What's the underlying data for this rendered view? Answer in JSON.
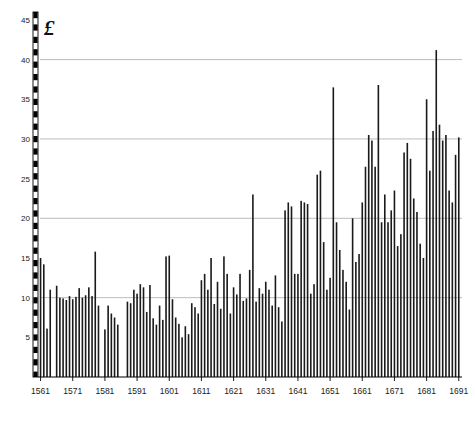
{
  "chart_data": {
    "type": "bar",
    "title": "",
    "subtitle": "",
    "xlabel": "",
    "ylabel": "£",
    "unit_symbol": "£",
    "xlim": [
      1560.2,
      1692.0
    ],
    "ylim": [
      0,
      46
    ],
    "yticks": [
      5,
      10,
      15,
      20,
      25,
      30,
      35,
      40,
      45
    ],
    "ytick_labels": [
      "5",
      "10",
      "15",
      "20",
      "25",
      "30",
      "35",
      "40",
      "45"
    ],
    "gridlines": [
      10,
      20,
      30,
      40
    ],
    "grid": true,
    "grid_color": "#b4b4b4",
    "legend": null,
    "legend_position": "none",
    "bar_color": "#1a1a1a",
    "axis_color": "#000000",
    "yaxis_style": "checkered-dashed",
    "xticks": [
      1561,
      1571,
      1581,
      1591,
      1601,
      1611,
      1621,
      1631,
      1641,
      1651,
      1661,
      1671,
      1681,
      1691
    ],
    "xtick_labels": [
      "1561",
      "1571",
      "1581",
      "1591",
      "1601",
      "1611",
      "1621",
      "1631",
      "1641",
      "1651",
      "1661",
      "1671",
      "1681",
      "1691"
    ],
    "x": [
      1561,
      1562,
      1563,
      1564,
      1566,
      1567,
      1568,
      1569,
      1570,
      1571,
      1572,
      1573,
      1574,
      1575,
      1576,
      1577,
      1578,
      1579,
      1581,
      1582,
      1583,
      1584,
      1585,
      1588,
      1589,
      1590,
      1591,
      1592,
      1593,
      1594,
      1595,
      1596,
      1597,
      1598,
      1599,
      1600,
      1601,
      1602,
      1603,
      1604,
      1605,
      1606,
      1607,
      1608,
      1609,
      1610,
      1611,
      1612,
      1613,
      1614,
      1615,
      1616,
      1617,
      1618,
      1619,
      1620,
      1621,
      1622,
      1623,
      1624,
      1625,
      1626,
      1627,
      1628,
      1629,
      1630,
      1631,
      1632,
      1633,
      1634,
      1635,
      1636,
      1637,
      1638,
      1639,
      1640,
      1641,
      1642,
      1643,
      1644,
      1645,
      1646,
      1647,
      1648,
      1649,
      1650,
      1651,
      1652,
      1653,
      1654,
      1655,
      1656,
      1657,
      1658,
      1659,
      1660,
      1661,
      1662,
      1663,
      1664,
      1665,
      1666,
      1667,
      1668,
      1669,
      1670,
      1671,
      1672,
      1673,
      1674,
      1675,
      1676,
      1677,
      1678,
      1679,
      1680,
      1681,
      1682,
      1683,
      1684,
      1685,
      1686,
      1687,
      1688,
      1689,
      1690,
      1691
    ],
    "values": [
      15.0,
      14.2,
      6.1,
      11.0,
      11.5,
      10.0,
      9.9,
      9.7,
      10.2,
      9.8,
      10.1,
      11.2,
      10.0,
      10.3,
      11.3,
      10.2,
      15.8,
      9.0,
      6.0,
      9.0,
      8.0,
      7.5,
      6.6,
      9.5,
      9.3,
      11.0,
      10.5,
      11.7,
      11.3,
      8.2,
      11.6,
      7.4,
      6.6,
      9.0,
      7.2,
      15.2,
      15.3,
      9.8,
      7.5,
      6.7,
      5.0,
      6.4,
      5.4,
      9.3,
      8.8,
      8.0,
      12.2,
      13.0,
      11.0,
      15.0,
      9.2,
      12.0,
      8.6,
      15.2,
      13.0,
      8.0,
      11.3,
      10.4,
      13.0,
      9.6,
      9.9,
      13.5,
      23.0,
      9.5,
      11.2,
      10.5,
      12.0,
      11.0,
      9.0,
      12.8,
      8.8,
      7.0,
      21.0,
      22.0,
      21.5,
      13.0,
      13.0,
      22.2,
      22.0,
      21.8,
      10.5,
      11.7,
      25.5,
      26.0,
      17.0,
      11.0,
      12.5,
      36.5,
      19.5,
      16.0,
      13.5,
      12.0,
      8.5,
      20.0,
      14.5,
      15.5,
      22.0,
      26.5,
      30.5,
      29.8,
      26.5,
      36.8,
      19.5,
      23.0,
      19.5,
      21.0,
      23.5,
      16.5,
      18.0,
      28.3,
      29.5,
      27.5,
      22.5,
      20.8,
      16.8,
      15.0,
      35.0,
      26.0,
      31.0,
      41.2,
      31.8,
      29.8,
      30.5,
      23.5,
      22.0,
      28.0,
      30.2
    ]
  },
  "meta": {
    "bar_width_px": 1.6,
    "axis_label_font_size": 8
  }
}
